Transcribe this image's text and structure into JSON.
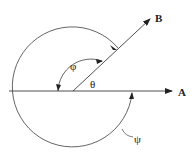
{
  "diagram": {
    "type": "angle-diagram",
    "labels": {
      "ray_a": "A",
      "ray_b": "B",
      "theta": "θ",
      "phi": "φ",
      "psi": "ψ"
    },
    "colors": {
      "stroke": "#222222",
      "background": "#ffffff"
    },
    "elements": [
      {
        "name": "ray-a",
        "description": "horizontal arrow pointing right to A"
      },
      {
        "name": "ray-b",
        "description": "arrow at ~45° pointing up-right to B"
      },
      {
        "name": "angle-theta",
        "description": "angle between A and B"
      },
      {
        "name": "angle-phi",
        "description": "arc from B counterclockwise to negative A direction"
      },
      {
        "name": "angle-psi",
        "description": "large arc around from A clockwise to B"
      }
    ]
  }
}
